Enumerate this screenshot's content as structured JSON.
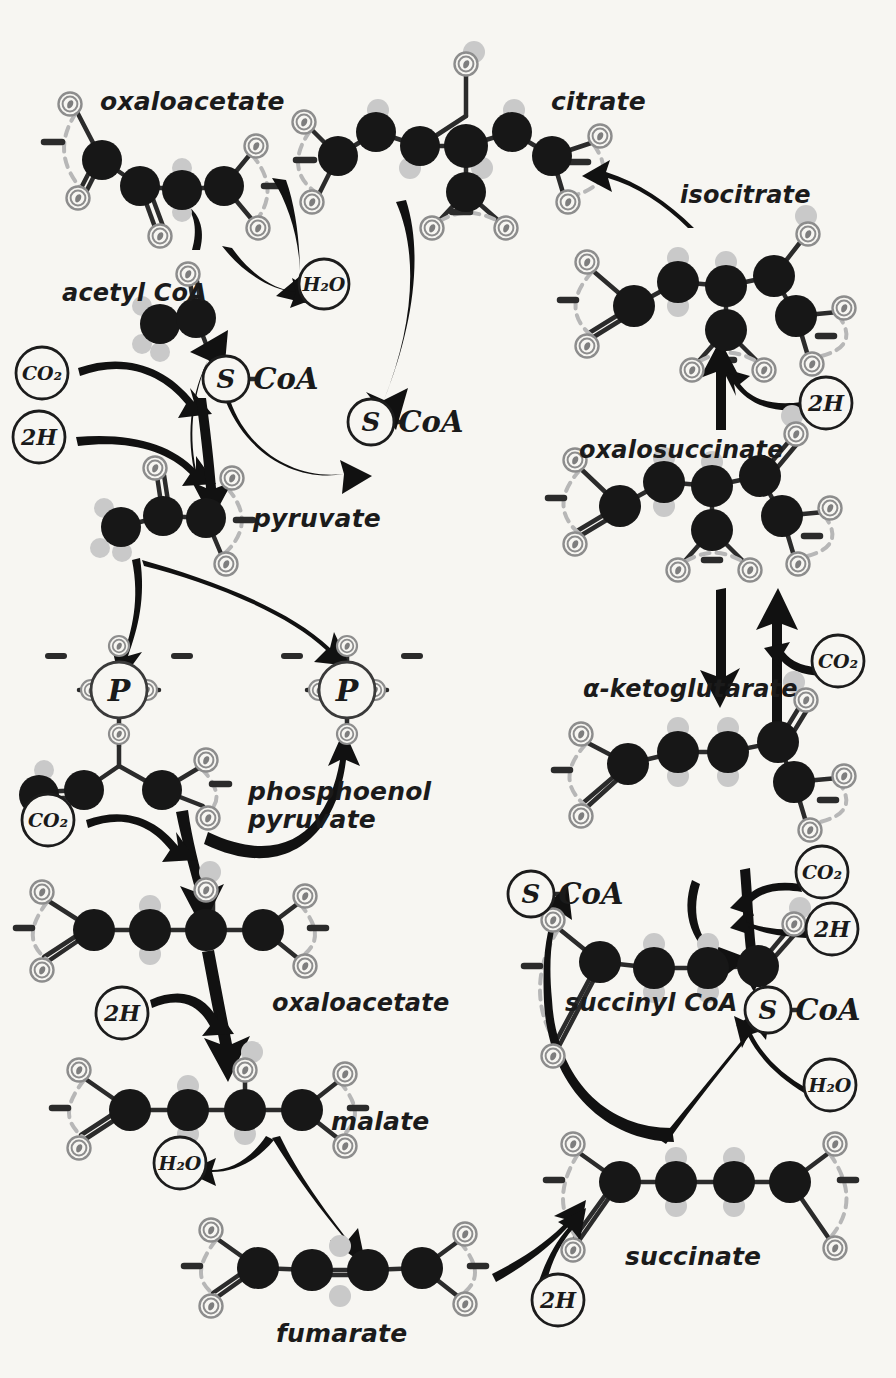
{
  "diagram": {
    "style": "hand-drawn ball-and-stick metabolic map",
    "background_color": "#f7f6f2",
    "carbon_color": "#171717",
    "hydrogen_color": "#c9c9c9",
    "oxygen_ring_color": "#8b8b8b",
    "arrow_color": "#111111",
    "label_color": "#1b1b1b"
  },
  "metabolite_labels": [
    {
      "id": "oxaloacetate-top",
      "text": "oxaloacetate",
      "x": 100,
      "y": 88,
      "size": 25
    },
    {
      "id": "citrate",
      "text": "citrate",
      "x": 551,
      "y": 88,
      "size": 25
    },
    {
      "id": "isocitrate",
      "text": "isocitrate",
      "x": 680,
      "y": 182,
      "size": 24
    },
    {
      "id": "acetyl-coa",
      "text": "acetyl CoA",
      "x": 62,
      "y": 280,
      "size": 24
    },
    {
      "id": "pyruvate",
      "text": "pyruvate",
      "x": 253,
      "y": 505,
      "size": 25
    },
    {
      "id": "oxalosuccinate",
      "text": "oxalosuccinate",
      "x": 579,
      "y": 437,
      "size": 24
    },
    {
      "id": "alpha-ketoglutarate",
      "text": "α-ketoglutarate",
      "x": 583,
      "y": 676,
      "size": 24
    },
    {
      "id": "phosphoenol-pyruvate",
      "text": "phosphoenol\npyruvate",
      "x": 248,
      "y": 778,
      "size": 25
    },
    {
      "id": "oxaloacetate-mid",
      "text": "oxaloacetate",
      "x": 272,
      "y": 990,
      "size": 24
    },
    {
      "id": "succinyl-coa",
      "text": "succinyl CoA",
      "x": 565,
      "y": 990,
      "size": 24
    },
    {
      "id": "malate",
      "text": "malate",
      "x": 331,
      "y": 1108,
      "size": 25
    },
    {
      "id": "succinate",
      "text": "succinate",
      "x": 625,
      "y": 1243,
      "size": 25
    },
    {
      "id": "fumarate",
      "text": "fumarate",
      "x": 276,
      "y": 1320,
      "size": 25
    }
  ],
  "cofactor_nodes": [
    {
      "id": "h2o-top",
      "text": "H₂O",
      "x": 324,
      "y": 284,
      "r": 25
    },
    {
      "id": "co2-acetyl",
      "text": "CO₂",
      "x": 42,
      "y": 373,
      "r": 26
    },
    {
      "id": "2h-acetyl",
      "text": "2H",
      "x": 39,
      "y": 437,
      "r": 26
    },
    {
      "id": "2h-isocit",
      "text": "2H",
      "x": 826,
      "y": 403,
      "r": 26
    },
    {
      "id": "co2-akg",
      "text": "CO₂",
      "x": 838,
      "y": 661,
      "r": 26
    },
    {
      "id": "co2-pep",
      "text": "CO₂",
      "x": 48,
      "y": 820,
      "r": 26
    },
    {
      "id": "co2-succoa",
      "text": "CO₂",
      "x": 822,
      "y": 872,
      "r": 26
    },
    {
      "id": "2h-succoa",
      "text": "2H",
      "x": 832,
      "y": 929,
      "r": 26
    },
    {
      "id": "2h-oaa",
      "text": "2H",
      "x": 122,
      "y": 1013,
      "r": 26
    },
    {
      "id": "h2o-succ",
      "text": "H₂O",
      "x": 830,
      "y": 1085,
      "r": 26
    },
    {
      "id": "h2o-fum",
      "text": "H₂O",
      "x": 180,
      "y": 1163,
      "r": 26
    },
    {
      "id": "2h-succinate",
      "text": "2H",
      "x": 558,
      "y": 1300,
      "r": 26
    }
  ],
  "group_labels": [
    {
      "id": "s-coa-acetyl",
      "s": "S",
      "coa": "CoA",
      "x": 226,
      "y": 379,
      "r": 23
    },
    {
      "id": "s-coa-free",
      "s": "S",
      "coa": "CoA",
      "x": 371,
      "y": 422,
      "r": 23
    },
    {
      "id": "s-coa-free2",
      "s": "S",
      "coa": "CoA",
      "x": 531,
      "y": 894,
      "r": 23
    },
    {
      "id": "s-coa-succ",
      "s": "S",
      "coa": "CoA",
      "x": 768,
      "y": 1010,
      "r": 23
    }
  ],
  "phosphate_nodes": [
    {
      "id": "p-left",
      "text": "P",
      "x": 119,
      "y": 690,
      "r": 28
    },
    {
      "id": "p-right",
      "text": "P",
      "x": 347,
      "y": 690,
      "r": 28
    }
  ],
  "atom_legend": {
    "carbon": "C",
    "hydrogen": "H",
    "oxygen": "O",
    "phosphorus": "P",
    "sulfur": "S"
  }
}
